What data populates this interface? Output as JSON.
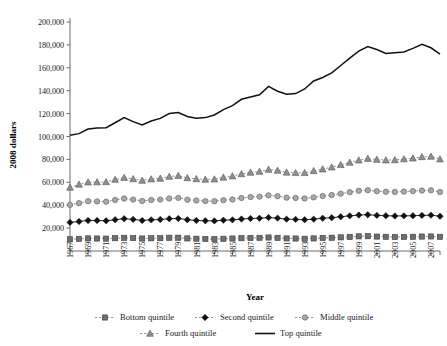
{
  "chart_data": {
    "type": "line",
    "title": "",
    "xlabel": "Year",
    "ylabel": "2008 dollars",
    "x": [
      1967,
      1968,
      1969,
      1970,
      1971,
      1972,
      1973,
      1974,
      1975,
      1976,
      1977,
      1978,
      1979,
      1980,
      1981,
      1982,
      1983,
      1984,
      1985,
      1986,
      1987,
      1988,
      1989,
      1990,
      1991,
      1992,
      1993,
      1994,
      1995,
      1996,
      1997,
      1998,
      1999,
      2000,
      2001,
      2002,
      2003,
      2004,
      2005,
      2006,
      2007,
      2008
    ],
    "xtick_labels": [
      "1967",
      "1969",
      "1971",
      "1973",
      "1975",
      "1977",
      "1979",
      "1981",
      "1983",
      "1985",
      "1987",
      "1989",
      "1991",
      "1993",
      "1995",
      "1997",
      "1999",
      "2001",
      "2003",
      "2005",
      "2007"
    ],
    "ylim": [
      0,
      200000
    ],
    "ytick_labels": [
      "20,000",
      "40,000",
      "60,000",
      "80,000",
      "100,000",
      "120,000",
      "140,000",
      "160,000",
      "180,000",
      "200,000"
    ],
    "yticks": [
      20000,
      40000,
      60000,
      80000,
      100000,
      120000,
      140000,
      160000,
      180000,
      200000
    ],
    "grid": false,
    "legend_position": "bottom",
    "series": [
      {
        "name": "Bottom quintile",
        "marker": "square",
        "color": "#6e6e6e",
        "line_style": "dashed",
        "values": [
          10200,
          10600,
          11000,
          10900,
          10800,
          11200,
          11500,
          11300,
          10900,
          11100,
          11200,
          11600,
          11600,
          11000,
          10700,
          10500,
          10400,
          10700,
          10900,
          11200,
          11400,
          11500,
          11800,
          11500,
          11000,
          10900,
          10700,
          11000,
          11400,
          11600,
          11900,
          12300,
          12800,
          12900,
          12600,
          12400,
          12200,
          12300,
          12400,
          12600,
          12700,
          12400
        ]
      },
      {
        "name": "Second quintile",
        "marker": "diamond",
        "color": "#111111",
        "line_style": "solid",
        "values": [
          25000,
          25800,
          26700,
          26600,
          26400,
          27300,
          28200,
          27600,
          26700,
          27200,
          27500,
          28200,
          28400,
          27300,
          26700,
          26400,
          26300,
          26900,
          27200,
          27900,
          28400,
          28600,
          29200,
          28700,
          27800,
          27600,
          27300,
          27800,
          28600,
          29100,
          29900,
          30700,
          31400,
          31700,
          31100,
          30800,
          30600,
          30700,
          30800,
          31100,
          31300,
          30400
        ]
      },
      {
        "name": "Middle quintile",
        "marker": "circle",
        "color": "#a8a8a8",
        "line_style": "dashed",
        "values": [
          40300,
          41800,
          43500,
          43300,
          43100,
          44600,
          45800,
          44900,
          43700,
          44500,
          44900,
          45900,
          46400,
          44800,
          44100,
          43600,
          43500,
          44400,
          45000,
          46300,
          47100,
          47500,
          48600,
          47900,
          46600,
          46300,
          45900,
          46800,
          48000,
          48900,
          50100,
          51400,
          52600,
          53100,
          52200,
          51800,
          51600,
          51900,
          52300,
          52800,
          53000,
          51500
        ]
      },
      {
        "name": "Fourth quintile",
        "marker": "triangle",
        "color": "#8f8f8f",
        "line_style": "dashed",
        "values": [
          55500,
          58200,
          60100,
          60200,
          60300,
          62400,
          64100,
          63000,
          61600,
          62800,
          63400,
          65000,
          65800,
          63800,
          63000,
          62500,
          62700,
          64300,
          65400,
          67300,
          68600,
          69400,
          71200,
          70300,
          68700,
          68300,
          68300,
          70000,
          71500,
          73200,
          75300,
          77300,
          79300,
          80700,
          79900,
          79400,
          79500,
          80300,
          81000,
          82200,
          82600,
          80200
        ]
      },
      {
        "name": "Top quintile",
        "marker": "none",
        "color": "#111111",
        "line_style": "solid",
        "values": [
          101000,
          102500,
          106500,
          107500,
          107700,
          112000,
          116500,
          113000,
          110000,
          113500,
          115800,
          120000,
          121000,
          117500,
          116000,
          116500,
          118800,
          123500,
          127000,
          132500,
          134500,
          136500,
          143800,
          139500,
          137000,
          137500,
          141500,
          148500,
          151500,
          155500,
          162000,
          168500,
          174500,
          178500,
          176000,
          172500,
          173200,
          173800,
          177000,
          180500,
          177500,
          172000
        ]
      }
    ]
  },
  "legend": {
    "items": [
      {
        "label": "Bottom quintile"
      },
      {
        "label": "Second quintile"
      },
      {
        "label": "Middle quintile"
      },
      {
        "label": "Fourth quintile"
      },
      {
        "label": "Top quintile"
      }
    ]
  }
}
